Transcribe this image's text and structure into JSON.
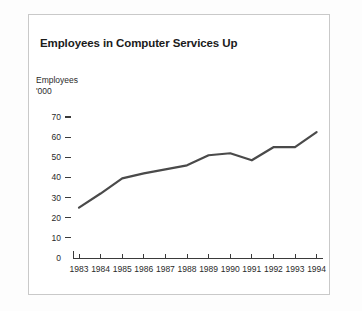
{
  "card": {
    "title": "Employees in Computer Services Up",
    "y_axis_caption_line1": "Employees",
    "y_axis_caption_line2": "'000"
  },
  "chart_data": {
    "type": "line",
    "title": "Employees in Computer Services Up",
    "xlabel": "",
    "ylabel": "Employees '000",
    "categories": [
      "1983",
      "1984",
      "1985",
      "1986",
      "1987",
      "1988",
      "1989",
      "1990",
      "1991",
      "1992",
      "1993",
      "1994"
    ],
    "values": [
      25,
      32,
      39.5,
      42,
      44,
      46,
      51,
      52,
      48.5,
      55,
      55,
      62.5
    ],
    "ylim": [
      0,
      70
    ],
    "yticks": [
      0,
      10,
      20,
      30,
      40,
      50,
      60,
      70
    ],
    "ytick_labels": [
      "0",
      "10",
      "20",
      "30",
      "40",
      "50",
      "60",
      "70"
    ],
    "xtick_labels": [
      "1983",
      "1984",
      "1985",
      "1986",
      "1987",
      "1988",
      "1989",
      "1990",
      "1991",
      "1992",
      "1993",
      "1994"
    ],
    "grid": false,
    "legend": null,
    "line_color": "#4a4a4a",
    "background_color": "#ffffff"
  }
}
